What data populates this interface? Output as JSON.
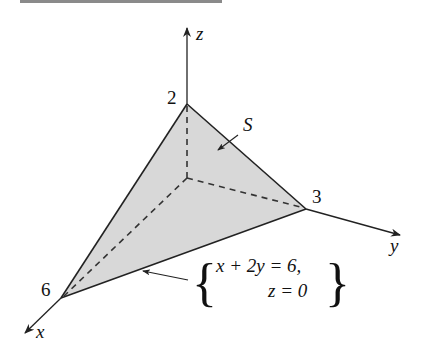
{
  "figure": {
    "colors": {
      "surface_fill": "#d8d8d8",
      "line": "#222222",
      "header_rule": "#8a8a8a"
    },
    "axes": {
      "x_label": "x",
      "y_label": "y",
      "z_label": "z"
    },
    "intercepts": {
      "x": "6",
      "y": "3",
      "z": "2"
    },
    "surface_label": "S",
    "edge_annotation": {
      "line1": "x + 2y = 6,",
      "line2": "z = 0",
      "brace_left": "{",
      "brace_right": "}"
    }
  }
}
